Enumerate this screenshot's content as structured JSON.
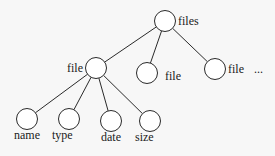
{
  "diagram": {
    "type": "tree",
    "colors": {
      "stroke": "#2a2a2a",
      "text": "#1a1a1a",
      "background": "#f7f7f7"
    },
    "nodes": {
      "root": {
        "label": "files",
        "cx": 165,
        "cy": 21,
        "r": 10.5,
        "lx": 178,
        "ly": 25
      },
      "file1": {
        "label": "file",
        "cx": 96,
        "cy": 68,
        "r": 10.5,
        "lx": 67,
        "ly": 72
      },
      "file2": {
        "label": "file",
        "cx": 147,
        "cy": 73,
        "r": 10.5,
        "lx": 165,
        "ly": 80
      },
      "file3": {
        "label": "file",
        "cx": 215,
        "cy": 69,
        "r": 10.5,
        "lx": 228,
        "ly": 73
      },
      "more": {
        "label": "...",
        "lx": 254,
        "ly": 73
      },
      "name": {
        "label": "name",
        "cx": 27,
        "cy": 119,
        "r": 10.5,
        "lx": 14,
        "ly": 139
      },
      "type": {
        "label": "type",
        "cx": 69,
        "cy": 119,
        "r": 10.5,
        "lx": 52,
        "ly": 139
      },
      "date": {
        "label": "date",
        "cx": 111,
        "cy": 121,
        "r": 10.5,
        "lx": 101,
        "ly": 141
      },
      "size": {
        "label": "size",
        "cx": 150,
        "cy": 121,
        "r": 10.5,
        "lx": 135,
        "ly": 141
      }
    },
    "edges": [
      [
        "root",
        "file1"
      ],
      [
        "root",
        "file2"
      ],
      [
        "root",
        "file3"
      ],
      [
        "file1",
        "name"
      ],
      [
        "file1",
        "type"
      ],
      [
        "file1",
        "date"
      ],
      [
        "file1",
        "size"
      ]
    ]
  }
}
